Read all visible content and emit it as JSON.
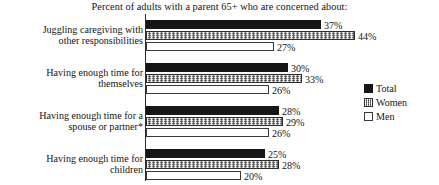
{
  "chart_data": {
    "type": "bar",
    "orientation": "horizontal",
    "title": "Percent of adults with a parent 65+ who are concerned about:",
    "xlabel": "",
    "ylabel": "",
    "xlim": [
      0,
      44
    ],
    "grid": false,
    "legend_position": "right",
    "value_suffix": "%",
    "categories": [
      "Juggling caregiving with other responsibilities",
      "Having enough time for themselves",
      "Having enough time for a spouse or partner*",
      "Having enough time for children"
    ],
    "category_lines": [
      [
        "Juggling caregiving with",
        "other responsibilities"
      ],
      [
        "Having enough time for",
        "themselves"
      ],
      [
        "Having enough time for a",
        "spouse or partner*"
      ],
      [
        "Having enough time for",
        "children"
      ]
    ],
    "series": [
      {
        "name": "Total",
        "key": "total",
        "color": "#161616",
        "values": [
          37,
          30,
          28,
          25
        ],
        "labels": [
          "37%",
          "30%",
          "28%",
          "25%"
        ]
      },
      {
        "name": "Women",
        "key": "women",
        "color": "#9d9d9d",
        "values": [
          44,
          33,
          29,
          28
        ],
        "labels": [
          "44%",
          "33%",
          "29%",
          "28%"
        ]
      },
      {
        "name": "Men",
        "key": "men",
        "color": "#ffffff",
        "values": [
          27,
          26,
          26,
          20
        ],
        "labels": [
          "27%",
          "26%",
          "26%",
          "20%"
        ]
      }
    ]
  },
  "legend": {
    "items": [
      {
        "label": "Total",
        "swatch": "total"
      },
      {
        "label": "Women",
        "swatch": "women"
      },
      {
        "label": "Men",
        "swatch": "men"
      }
    ]
  }
}
